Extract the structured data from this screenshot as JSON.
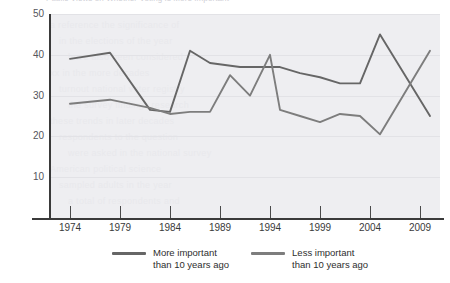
{
  "header": {
    "clipped_title": "Public Views on Whether Voting Is More Important"
  },
  "chart_data": {
    "type": "line",
    "title": "",
    "xlabel": "",
    "ylabel": "",
    "xlim": [
      1972,
      2011
    ],
    "ylim": [
      0,
      50
    ],
    "grid": true,
    "legend_position": "bottom",
    "yticks": [
      10,
      20,
      30,
      40,
      50
    ],
    "xticks": [
      1974,
      1979,
      1984,
      1989,
      1994,
      1999,
      2004,
      2009
    ],
    "series": [
      {
        "name": "More important\nthan 10 years ago",
        "color": "#666666",
        "points": [
          [
            1974,
            39.0
          ],
          [
            1978,
            40.5
          ],
          [
            1982,
            26.5
          ],
          [
            1984,
            26.0
          ],
          [
            1986,
            41.0
          ],
          [
            1988,
            38.0
          ],
          [
            1991,
            37.0
          ],
          [
            1993,
            37.0
          ],
          [
            1995,
            37.0
          ],
          [
            1997,
            35.5
          ],
          [
            1999,
            34.5
          ],
          [
            2001,
            33.0
          ],
          [
            2003,
            33.0
          ],
          [
            2005,
            45.0
          ],
          [
            2010,
            25.0
          ]
        ]
      },
      {
        "name": "Less important\nthan 10 years ago",
        "color": "#7d7d7d",
        "points": [
          [
            1974,
            28.0
          ],
          [
            1978,
            29.0
          ],
          [
            1982,
            27.0
          ],
          [
            1984,
            25.5
          ],
          [
            1986,
            26.0
          ],
          [
            1988,
            26.0
          ],
          [
            1990,
            35.0
          ],
          [
            1992,
            30.0
          ],
          [
            1994,
            40.0
          ],
          [
            1995,
            26.5
          ],
          [
            1997,
            25.0
          ],
          [
            1999,
            23.5
          ],
          [
            2001,
            25.5
          ],
          [
            2003,
            25.0
          ],
          [
            2005,
            20.5
          ],
          [
            2010,
            41.0
          ]
        ]
      }
    ]
  },
  "legend": {
    "items": [
      {
        "label": "More important\nthan 10 years ago",
        "color": "#666666"
      },
      {
        "label": "Less important\nthan 10 years ago",
        "color": "#7d7d7d"
      }
    ]
  },
  "watermark": {
    "lines": [
      "a reference the significance of",
      "in the elections of the year",
      "have also been considered",
      "xx in the more decades",
      "turnout national voter registry",
      "the survey findings research",
      "these trends in later decades",
      "respondents to the question",
      "were asked in the national survey",
      "American political science",
      "sampled adults in the year",
      "a total of respondents and"
    ]
  }
}
